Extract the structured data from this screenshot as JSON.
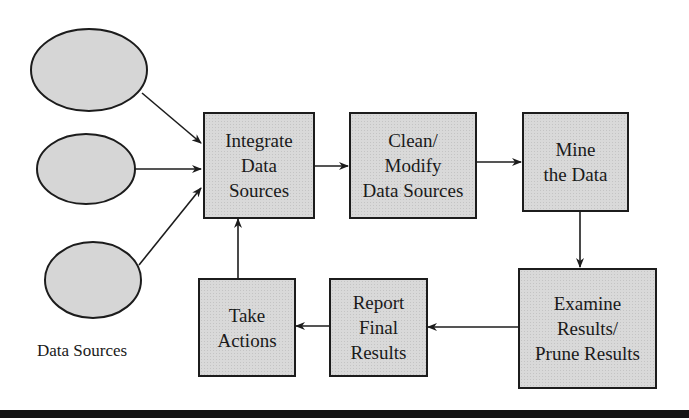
{
  "diagram": {
    "nodes": [
      {
        "id": "integrate",
        "label": "Integrate\nData\nSources"
      },
      {
        "id": "clean",
        "label": "Clean/\nModify\nData Sources"
      },
      {
        "id": "mine",
        "label": "Mine\nthe Data"
      },
      {
        "id": "examine",
        "label": "Examine\nResults/\nPrune Results"
      },
      {
        "id": "report",
        "label": "Report\nFinal\nResults"
      },
      {
        "id": "take",
        "label": "Take\nActions"
      }
    ],
    "data_sources": {
      "count": 3,
      "caption": "Data Sources"
    },
    "edges": [
      {
        "from": "data-source-1",
        "to": "integrate"
      },
      {
        "from": "data-source-2",
        "to": "integrate"
      },
      {
        "from": "data-source-3",
        "to": "integrate"
      },
      {
        "from": "integrate",
        "to": "clean"
      },
      {
        "from": "clean",
        "to": "mine"
      },
      {
        "from": "mine",
        "to": "examine"
      },
      {
        "from": "examine",
        "to": "report"
      },
      {
        "from": "report",
        "to": "take"
      },
      {
        "from": "take",
        "to": "integrate"
      }
    ],
    "colors": {
      "fill": "#d9d9d9",
      "stroke": "#1c1c1c",
      "rule": "#141414"
    }
  }
}
